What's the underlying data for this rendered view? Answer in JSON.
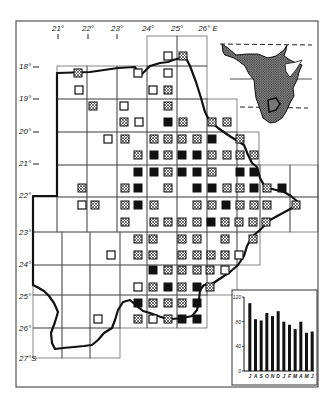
{
  "map": {
    "frame": {
      "x": 16,
      "y": 21,
      "w": 302,
      "h": 366
    },
    "longitude_labels": [
      {
        "text": "21°",
        "x": 58,
        "tick": true
      },
      {
        "text": "22°",
        "x": 88,
        "tick": true
      },
      {
        "text": "23°",
        "x": 117,
        "tick": true
      },
      {
        "text": "24°",
        "x": 148,
        "tick": false
      },
      {
        "text": "25°",
        "x": 177,
        "tick": false
      },
      {
        "text": "26° E",
        "x": 208,
        "tick": false
      }
    ],
    "latitude_labels": [
      {
        "text": "18°",
        "y": 66,
        "dash": true
      },
      {
        "text": "19°",
        "y": 98,
        "dash": true
      },
      {
        "text": "20°",
        "y": 131,
        "dash": true
      },
      {
        "text": "21°",
        "y": 163,
        "dash": true
      },
      {
        "text": "22°",
        "y": 195,
        "dash": false
      },
      {
        "text": "23°",
        "y": 232,
        "dash": false
      },
      {
        "text": "24°",
        "y": 264,
        "dash": false
      },
      {
        "text": "25°",
        "y": 296,
        "dash": false
      },
      {
        "text": "26°",
        "y": 328,
        "dash": false
      },
      {
        "text": "27°S",
        "y": 358,
        "dash": false
      }
    ],
    "grid_cells": [
      [
        147,
        36,
        30,
        30
      ],
      [
        177,
        36,
        30,
        30
      ],
      [
        57,
        66,
        30,
        33
      ],
      [
        87,
        66,
        30,
        33
      ],
      [
        117,
        66,
        30,
        33
      ],
      [
        147,
        66,
        30,
        33
      ],
      [
        177,
        66,
        30,
        33
      ],
      [
        57,
        99,
        30,
        33
      ],
      [
        87,
        99,
        30,
        33
      ],
      [
        117,
        99,
        30,
        33
      ],
      [
        147,
        99,
        30,
        33
      ],
      [
        177,
        99,
        30,
        33
      ],
      [
        207,
        99,
        30,
        33
      ],
      [
        57,
        132,
        30,
        33
      ],
      [
        87,
        132,
        30,
        33
      ],
      [
        117,
        132,
        30,
        33
      ],
      [
        147,
        132,
        30,
        33
      ],
      [
        177,
        132,
        30,
        33
      ],
      [
        207,
        132,
        30,
        33
      ],
      [
        237,
        132,
        22,
        33
      ],
      [
        57,
        165,
        30,
        32
      ],
      [
        87,
        165,
        30,
        32
      ],
      [
        117,
        165,
        30,
        32
      ],
      [
        147,
        165,
        30,
        32
      ],
      [
        177,
        165,
        30,
        32
      ],
      [
        207,
        165,
        30,
        32
      ],
      [
        237,
        165,
        23,
        32
      ],
      [
        260,
        165,
        30,
        32
      ],
      [
        290,
        165,
        28,
        32
      ],
      [
        33,
        197,
        24,
        35
      ],
      [
        57,
        197,
        30,
        35
      ],
      [
        87,
        197,
        30,
        35
      ],
      [
        117,
        197,
        30,
        35
      ],
      [
        147,
        197,
        30,
        35
      ],
      [
        177,
        197,
        30,
        35
      ],
      [
        207,
        197,
        30,
        35
      ],
      [
        237,
        197,
        23,
        35
      ],
      [
        260,
        197,
        30,
        35
      ],
      [
        290,
        197,
        28,
        35
      ],
      [
        33,
        232,
        29,
        33
      ],
      [
        62,
        232,
        28,
        33
      ],
      [
        90,
        232,
        30,
        33
      ],
      [
        120,
        232,
        27,
        33
      ],
      [
        147,
        232,
        30,
        33
      ],
      [
        177,
        232,
        30,
        33
      ],
      [
        207,
        232,
        30,
        33
      ],
      [
        237,
        232,
        23,
        33
      ],
      [
        33,
        265,
        29,
        30
      ],
      [
        62,
        265,
        28,
        30
      ],
      [
        90,
        265,
        30,
        30
      ],
      [
        120,
        265,
        27,
        30
      ],
      [
        147,
        265,
        30,
        30
      ],
      [
        177,
        265,
        30,
        30
      ],
      [
        207,
        265,
        30,
        30
      ],
      [
        33,
        295,
        29,
        33
      ],
      [
        62,
        295,
        28,
        33
      ],
      [
        90,
        295,
        30,
        33
      ],
      [
        120,
        295,
        27,
        33
      ],
      [
        147,
        295,
        30,
        33
      ],
      [
        177,
        295,
        30,
        33
      ],
      [
        33,
        328,
        29,
        30
      ],
      [
        62,
        328,
        28,
        30
      ],
      [
        90,
        328,
        30,
        30
      ]
    ],
    "border_path": "M57,358 M57,73 L90,72 L118,68 L135,67 L140,76 L144,72 L150,66 L160,63 L168,62 L173,60 L181,58 L186,58 L190,66 L196,82 L201,98 L205,112 L209,120 L218,128 L228,135 L236,140 L244,145 L248,155 L252,163 L257,167 L260,178 L265,187 L276,190 L284,192 L291,196 L298,202 L292,208 L281,214 L270,220 L262,228 L252,237 L247,246 L244,256 L238,265 L230,272 L221,278 L212,284 L204,285 L200,290 L199,300 L197,310 L192,316 L183,318 L172,319 L164,318 L158,316 L150,313 L143,311 L137,306 L130,300 L123,302 L118,310 L115,320 L112,328 L104,333 L98,340 L92,345 L84,346 L74,347 L63,348 L55,349 L52,343 L51,333 L55,322 L58,312 L54,303 L49,296 L44,291 L37,287 L33,285 L33,196 L57,196 Z",
    "symbols": [
      {
        "t": "open",
        "x": 168,
        "y": 56
      },
      {
        "t": "cross",
        "x": 183,
        "y": 56
      },
      {
        "t": "cross",
        "x": 78,
        "y": 73
      },
      {
        "t": "open",
        "x": 138,
        "y": 73
      },
      {
        "t": "open",
        "x": 168,
        "y": 73
      },
      {
        "t": "open",
        "x": 79,
        "y": 90
      },
      {
        "t": "open",
        "x": 153,
        "y": 90
      },
      {
        "t": "cross",
        "x": 168,
        "y": 90
      },
      {
        "t": "cross",
        "x": 93,
        "y": 106
      },
      {
        "t": "open",
        "x": 124,
        "y": 106
      },
      {
        "t": "cross",
        "x": 168,
        "y": 106
      },
      {
        "t": "cross",
        "x": 124,
        "y": 122
      },
      {
        "t": "open",
        "x": 139,
        "y": 122
      },
      {
        "t": "black",
        "x": 168,
        "y": 122
      },
      {
        "t": "cross",
        "x": 183,
        "y": 122
      },
      {
        "t": "cross",
        "x": 212,
        "y": 122
      },
      {
        "t": "cross",
        "x": 227,
        "y": 122
      },
      {
        "t": "open",
        "x": 108,
        "y": 139
      },
      {
        "t": "cross",
        "x": 125,
        "y": 139
      },
      {
        "t": "cross",
        "x": 154,
        "y": 139
      },
      {
        "t": "cross",
        "x": 168,
        "y": 139
      },
      {
        "t": "cross",
        "x": 182,
        "y": 139
      },
      {
        "t": "cross",
        "x": 197,
        "y": 139
      },
      {
        "t": "black",
        "x": 212,
        "y": 139
      },
      {
        "t": "cross",
        "x": 240,
        "y": 139
      },
      {
        "t": "cross",
        "x": 138,
        "y": 155
      },
      {
        "t": "black",
        "x": 154,
        "y": 155
      },
      {
        "t": "cross",
        "x": 168,
        "y": 155
      },
      {
        "t": "black",
        "x": 182,
        "y": 155
      },
      {
        "t": "black",
        "x": 197,
        "y": 155
      },
      {
        "t": "cross",
        "x": 212,
        "y": 155
      },
      {
        "t": "cross",
        "x": 227,
        "y": 155
      },
      {
        "t": "cross",
        "x": 240,
        "y": 155
      },
      {
        "t": "cross",
        "x": 254,
        "y": 155
      },
      {
        "t": "black",
        "x": 138,
        "y": 172
      },
      {
        "t": "black",
        "x": 154,
        "y": 172
      },
      {
        "t": "cross",
        "x": 168,
        "y": 172
      },
      {
        "t": "black",
        "x": 182,
        "y": 172
      },
      {
        "t": "black",
        "x": 197,
        "y": 172
      },
      {
        "t": "cross",
        "x": 212,
        "y": 172
      },
      {
        "t": "black",
        "x": 240,
        "y": 172
      },
      {
        "t": "black",
        "x": 254,
        "y": 172
      },
      {
        "t": "cross",
        "x": 82,
        "y": 188
      },
      {
        "t": "cross",
        "x": 125,
        "y": 188
      },
      {
        "t": "black",
        "x": 138,
        "y": 188
      },
      {
        "t": "cross",
        "x": 168,
        "y": 188
      },
      {
        "t": "black",
        "x": 197,
        "y": 188
      },
      {
        "t": "black",
        "x": 212,
        "y": 188
      },
      {
        "t": "cross",
        "x": 227,
        "y": 188
      },
      {
        "t": "cross",
        "x": 240,
        "y": 188
      },
      {
        "t": "black",
        "x": 254,
        "y": 188
      },
      {
        "t": "cross",
        "x": 267,
        "y": 188
      },
      {
        "t": "black",
        "x": 282,
        "y": 188
      },
      {
        "t": "open",
        "x": 82,
        "y": 205
      },
      {
        "t": "cross",
        "x": 95,
        "y": 205
      },
      {
        "t": "cross",
        "x": 125,
        "y": 205
      },
      {
        "t": "black",
        "x": 138,
        "y": 205
      },
      {
        "t": "cross",
        "x": 154,
        "y": 205
      },
      {
        "t": "cross",
        "x": 197,
        "y": 205
      },
      {
        "t": "cross",
        "x": 212,
        "y": 205
      },
      {
        "t": "black",
        "x": 226,
        "y": 205
      },
      {
        "t": "cross",
        "x": 240,
        "y": 205
      },
      {
        "t": "cross",
        "x": 254,
        "y": 205
      },
      {
        "t": "cross",
        "x": 267,
        "y": 205
      },
      {
        "t": "cross",
        "x": 296,
        "y": 205
      },
      {
        "t": "cross",
        "x": 125,
        "y": 222
      },
      {
        "t": "cross",
        "x": 154,
        "y": 222
      },
      {
        "t": "cross",
        "x": 168,
        "y": 222
      },
      {
        "t": "cross",
        "x": 182,
        "y": 222
      },
      {
        "t": "cross",
        "x": 197,
        "y": 222
      },
      {
        "t": "black",
        "x": 211,
        "y": 222
      },
      {
        "t": "cross",
        "x": 225,
        "y": 222
      },
      {
        "t": "cross",
        "x": 239,
        "y": 222
      },
      {
        "t": "cross",
        "x": 253,
        "y": 222
      },
      {
        "t": "cross",
        "x": 266,
        "y": 222
      },
      {
        "t": "cross",
        "x": 138,
        "y": 239
      },
      {
        "t": "cross",
        "x": 153,
        "y": 239
      },
      {
        "t": "cross",
        "x": 182,
        "y": 239
      },
      {
        "t": "cross",
        "x": 197,
        "y": 239
      },
      {
        "t": "cross",
        "x": 225,
        "y": 239
      },
      {
        "t": "cross",
        "x": 253,
        "y": 239
      },
      {
        "t": "open",
        "x": 111,
        "y": 255
      },
      {
        "t": "cross",
        "x": 138,
        "y": 255
      },
      {
        "t": "cross",
        "x": 153,
        "y": 255
      },
      {
        "t": "cross",
        "x": 182,
        "y": 255
      },
      {
        "t": "cross",
        "x": 197,
        "y": 255
      },
      {
        "t": "cross",
        "x": 211,
        "y": 255
      },
      {
        "t": "cross",
        "x": 225,
        "y": 255
      },
      {
        "t": "open",
        "x": 239,
        "y": 255
      },
      {
        "t": "black",
        "x": 153,
        "y": 270
      },
      {
        "t": "cross",
        "x": 168,
        "y": 270
      },
      {
        "t": "cross",
        "x": 182,
        "y": 270
      },
      {
        "t": "cross",
        "x": 197,
        "y": 270
      },
      {
        "t": "cross",
        "x": 210,
        "y": 270
      },
      {
        "t": "open",
        "x": 225,
        "y": 270
      },
      {
        "t": "open",
        "x": 138,
        "y": 287
      },
      {
        "t": "cross",
        "x": 153,
        "y": 287
      },
      {
        "t": "black",
        "x": 168,
        "y": 287
      },
      {
        "t": "cross",
        "x": 182,
        "y": 287
      },
      {
        "t": "black",
        "x": 197,
        "y": 287
      },
      {
        "t": "cross",
        "x": 210,
        "y": 287
      },
      {
        "t": "black",
        "x": 138,
        "y": 303
      },
      {
        "t": "cross",
        "x": 153,
        "y": 303
      },
      {
        "t": "cross",
        "x": 168,
        "y": 303
      },
      {
        "t": "cross",
        "x": 182,
        "y": 303
      },
      {
        "t": "black",
        "x": 197,
        "y": 303
      },
      {
        "t": "open",
        "x": 98,
        "y": 319
      },
      {
        "t": "cross",
        "x": 138,
        "y": 319
      },
      {
        "t": "open",
        "x": 153,
        "y": 319
      },
      {
        "t": "cross",
        "x": 168,
        "y": 319
      },
      {
        "t": "black",
        "x": 182,
        "y": 319
      },
      {
        "t": "black",
        "x": 197,
        "y": 319
      }
    ],
    "symbol_types": {
      "open": "recorded-open-square",
      "cross": "hatched-square",
      "black": "filled-square"
    },
    "colors": {
      "ink": "#111111",
      "paper": "#ffffff",
      "grid": "#555555"
    }
  },
  "inset_map": {
    "label": "Africa locator",
    "highlight": "study-area-outline"
  },
  "chart_data": {
    "type": "bar",
    "title": "",
    "xlabel": "",
    "ylabel": "",
    "categories": [
      "J",
      "A",
      "S",
      "O",
      "N",
      "D",
      "J",
      "F",
      "M",
      "A",
      "M",
      "J"
    ],
    "values": [
      110,
      84,
      82,
      94,
      89,
      97,
      80,
      75,
      68,
      80,
      62,
      64
    ],
    "yticks": [
      0,
      40,
      80,
      120
    ],
    "ylim": [
      0,
      120
    ],
    "grid": false,
    "legend": null
  },
  "chart_box": {
    "x": 232,
    "y": 290,
    "w": 85,
    "h": 95
  }
}
